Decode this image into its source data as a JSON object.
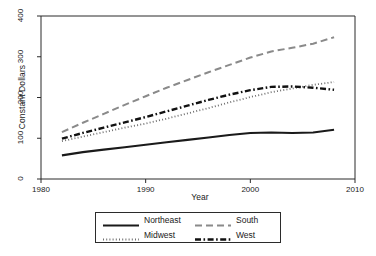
{
  "chart_data": {
    "type": "line",
    "title": "",
    "xlabel": "Year",
    "ylabel": "Constant Dollars",
    "xlim": [
      1980,
      2010
    ],
    "ylim": [
      0,
      400
    ],
    "xticks": [
      1980,
      1990,
      2000,
      2010
    ],
    "yticks": [
      0,
      100,
      200,
      300,
      400
    ],
    "grid": false,
    "legend_position": "below-center",
    "x": [
      1982,
      1984,
      1986,
      1988,
      1990,
      1992,
      1994,
      1996,
      1998,
      2000,
      2002,
      2004,
      2006,
      2008
    ],
    "series": [
      {
        "name": "Northeast",
        "style": "solid",
        "color": "#1a1a1a",
        "width": 2.1,
        "values": [
          58,
          66,
          72,
          78,
          84,
          90,
          96,
          102,
          108,
          113,
          114,
          113,
          114,
          121
        ]
      },
      {
        "name": "South",
        "style": "dashed",
        "color": "#8a8a8a",
        "width": 2.0,
        "values": [
          115,
          138,
          160,
          182,
          203,
          224,
          243,
          262,
          280,
          298,
          313,
          322,
          332,
          348
        ]
      },
      {
        "name": "Midwest",
        "style": "dotted",
        "color": "#6f6f6f",
        "width": 1.8,
        "values": [
          93,
          104,
          115,
          126,
          136,
          148,
          161,
          174,
          188,
          201,
          213,
          222,
          231,
          238
        ]
      },
      {
        "name": "West",
        "style": "dashdot",
        "color": "#111111",
        "width": 2.4,
        "values": [
          99,
          113,
          126,
          139,
          152,
          166,
          180,
          194,
          207,
          218,
          226,
          227,
          224,
          219
        ]
      }
    ]
  },
  "axes": {
    "ylabel_text": "Constant Dollars",
    "xlabel_text": "Year",
    "ytick_labels": [
      "0",
      "100",
      "200",
      "300",
      "400"
    ],
    "xtick_labels": [
      "1980",
      "1990",
      "2000",
      "2010"
    ]
  },
  "legend": {
    "entries": [
      {
        "label": "Northeast",
        "style": "solid"
      },
      {
        "label": "South",
        "style": "dashed"
      },
      {
        "label": "Midwest",
        "style": "dotted"
      },
      {
        "label": "West",
        "style": "dashdot"
      }
    ]
  }
}
